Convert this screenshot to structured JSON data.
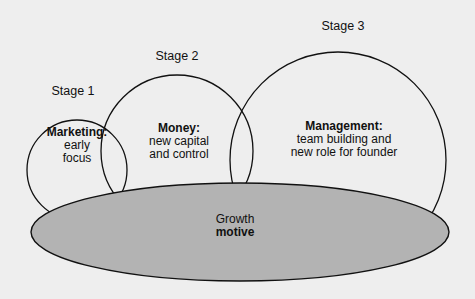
{
  "diagram": {
    "type": "venn-stages",
    "background_color": "#eeeeee",
    "stroke_color": "#111111",
    "base_fill_color": "#b3b3b3",
    "stages": [
      {
        "label": "Stage 1",
        "title": "Marketing:",
        "lines": [
          "early",
          "focus"
        ],
        "circle": {
          "cx": 77,
          "cy": 170,
          "r": 50
        }
      },
      {
        "label": "Stage 2",
        "title": "Money:",
        "lines": [
          "new capital",
          "and control"
        ],
        "circle": {
          "cx": 177,
          "cy": 151,
          "r": 76
        }
      },
      {
        "label": "Stage 3",
        "title": "Management:",
        "lines": [
          "team building and",
          "new role for founder"
        ],
        "circle": {
          "cx": 338,
          "cy": 160,
          "r": 108
        }
      }
    ],
    "base": {
      "line1": "Growth",
      "line2": "motive",
      "ellipse": {
        "cx": 240,
        "cy": 232,
        "rx": 209,
        "ry": 49
      }
    }
  }
}
